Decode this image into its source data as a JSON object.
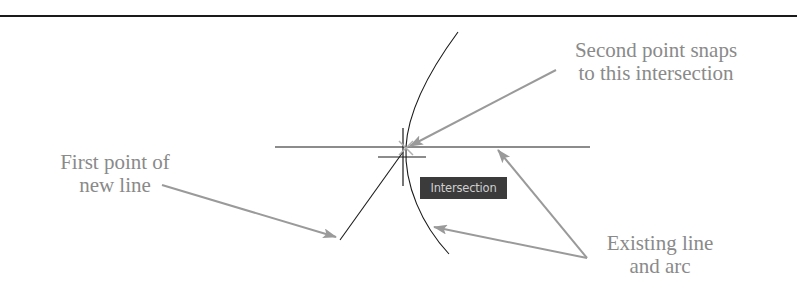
{
  "diagram": {
    "labels": {
      "second_point": [
        "Second point snaps",
        "to this intersection"
      ],
      "first_point": [
        "First point of",
        "new line"
      ],
      "existing": [
        "Existing line",
        "and arc"
      ]
    },
    "tooltip": {
      "text": "Intersection"
    },
    "colors": {
      "background": "#ffffff",
      "geometry": "#1a1a1a",
      "annotation_text": "#8a8a8a",
      "arrow": "#9a9a9a",
      "tooltip_bg": "#3b3b3b",
      "tooltip_text": "#cfcfcf"
    },
    "elements": {
      "existing_line": {
        "x1": 275,
        "y1": 147,
        "x2": 590,
        "y2": 147
      },
      "existing_arc": {
        "start": [
          458,
          32
        ],
        "mid": [
          408,
          147
        ],
        "end": [
          449,
          254
        ]
      },
      "new_line": {
        "from": [
          340,
          240
        ],
        "to": [
          405,
          148
        ]
      },
      "crosshair": {
        "cx": 403,
        "cy": 157,
        "arm_h": 24,
        "arm_v": 34
      },
      "snap_point": [
        406,
        148
      ]
    },
    "arrows": [
      {
        "name": "second-point-arrow",
        "from": [
          556,
          70
        ],
        "to": [
          410,
          146
        ]
      },
      {
        "name": "first-point-arrow",
        "from": [
          162,
          185
        ],
        "to": [
          336,
          237
        ]
      },
      {
        "name": "existing-line-arrow",
        "from": [
          587,
          258
        ],
        "to": [
          498,
          150
        ]
      },
      {
        "name": "existing-arc-arrow",
        "from": [
          587,
          258
        ],
        "to": [
          434,
          227
        ]
      }
    ]
  }
}
